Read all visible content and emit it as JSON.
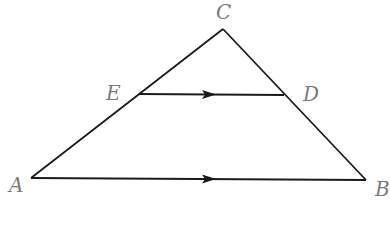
{
  "figure": {
    "type": "triangle-with-parallel-segment",
    "stroke_color": "#1a1a1a",
    "label_color": "#7a7a7a",
    "background": "#ffffff",
    "points": {
      "A": {
        "label": "A",
        "x": 31,
        "y": 178
      },
      "B": {
        "label": "B",
        "x": 366,
        "y": 180
      },
      "C": {
        "label": "C",
        "x": 223,
        "y": 29
      },
      "D": {
        "label": "D",
        "x": 284,
        "y": 95
      },
      "E": {
        "label": "E",
        "x": 139,
        "y": 94
      }
    },
    "segments": [
      {
        "from": "A",
        "to": "C"
      },
      {
        "from": "C",
        "to": "B"
      },
      {
        "from": "A",
        "to": "B",
        "arrow": true
      },
      {
        "from": "E",
        "to": "D",
        "arrow": true
      }
    ],
    "relation": "ED parallel to AB"
  }
}
